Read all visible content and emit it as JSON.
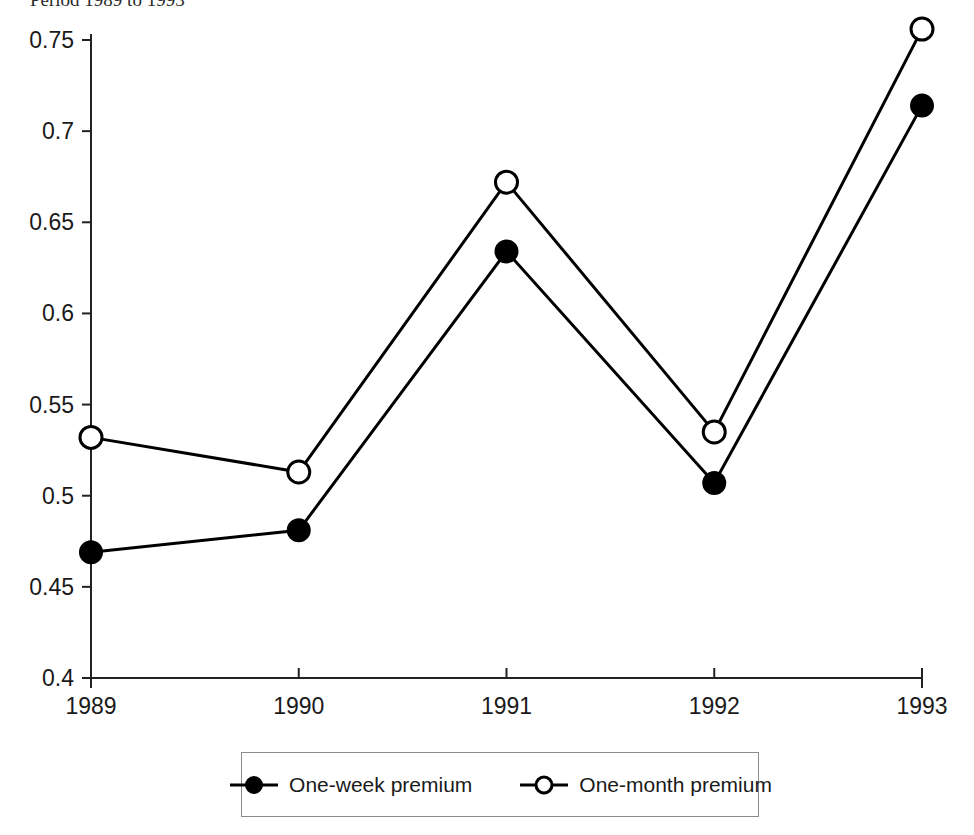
{
  "caption": {
    "text": "Period 1989 to 1993"
  },
  "legend": {
    "position": "bottom-center",
    "entries": [
      {
        "label": "One-week premium",
        "marker": "filled-circle-icon",
        "color": "#000000"
      },
      {
        "label": "One-month premium",
        "marker": "open-circle-icon",
        "color": "#000000"
      }
    ]
  },
  "chart_data": {
    "type": "line",
    "title": "",
    "xlabel": "",
    "ylabel": "",
    "categories": [
      "1989",
      "1990",
      "1991",
      "1992",
      "1993"
    ],
    "x": [
      1989,
      1990,
      1991,
      1992,
      1993
    ],
    "xlim": [
      1989,
      1993
    ],
    "ylim": [
      0.4,
      0.75
    ],
    "yticks": [
      0.4,
      0.45,
      0.5,
      0.55,
      0.6,
      0.65,
      0.7,
      0.75
    ],
    "ytick_labels": [
      "0.4",
      "0.45",
      "0.5",
      "0.55",
      "0.6",
      "0.65",
      "0.7",
      "0.75"
    ],
    "xticks": [
      1989,
      1990,
      1991,
      1992,
      1993
    ],
    "xtick_labels": [
      "1989",
      "1990",
      "1991",
      "1992",
      "1993"
    ],
    "grid": false,
    "legend_position": "bottom-center",
    "series": [
      {
        "name": "One-week premium",
        "marker": "filled-circle",
        "color": "#000000",
        "values": [
          0.469,
          0.481,
          0.634,
          0.507,
          0.714
        ]
      },
      {
        "name": "One-month premium",
        "marker": "open-circle",
        "color": "#000000",
        "values": [
          0.532,
          0.513,
          0.672,
          0.535,
          0.756
        ]
      }
    ]
  }
}
